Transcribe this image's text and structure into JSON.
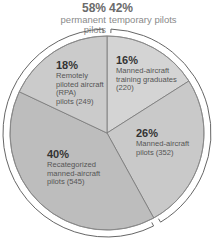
{
  "chart_data": {
    "type": "pie",
    "title": "",
    "groups": [
      {
        "name": "permanent pilots",
        "percent": 58,
        "slices": [
          "Remotely piloted aircraft (RPA) pilots",
          "Recategorized manned-aircraft pilots"
        ]
      },
      {
        "name": "temporary pilots",
        "percent": 42,
        "slices": [
          "Manned-aircraft training graduates",
          "Manned-aircraft pilots"
        ]
      }
    ],
    "categories": [
      "Manned-aircraft training graduates",
      "Manned-aircraft pilots",
      "Recategorized manned-aircraft pilots",
      "Remotely piloted aircraft (RPA) pilots"
    ],
    "values": [
      220,
      352,
      545,
      249
    ],
    "percentages": [
      16,
      26,
      40,
      18
    ],
    "colors": [
      "#d4d4d4",
      "#c9c9c9",
      "#bdbdbd",
      "#cbcbcb"
    ],
    "legend": "none (direct labels)"
  },
  "header": {
    "permanent": {
      "percent": "58%",
      "label": "permanent pilots"
    },
    "temporary": {
      "percent": "42%",
      "label": "temporary pilots"
    }
  },
  "slices": [
    {
      "percent": "16%",
      "lines": [
        "Manned-aircraft",
        "training graduates",
        "(220)"
      ]
    },
    {
      "percent": "26%",
      "lines": [
        "Manned-aircraft",
        "pilots (352)"
      ]
    },
    {
      "percent": "40%",
      "lines": [
        "Recategorized",
        "manned-aircraft",
        "pilots (545)"
      ]
    },
    {
      "percent": "18%",
      "lines": [
        "Remotely",
        "piloted aircraft",
        "(RPA)",
        "pilots (249)"
      ]
    }
  ]
}
